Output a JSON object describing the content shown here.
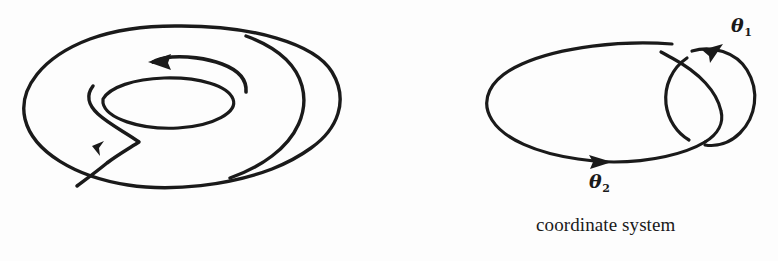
{
  "page": {
    "background_color": "#fdfdfd",
    "ink_color": "#1a1a1a",
    "width": 778,
    "height": 261
  },
  "figures": {
    "torus": {
      "name": "torus-diagram",
      "description": "torus with two oriented loop arrows",
      "arrows": [
        {
          "name": "meridian-arrow",
          "direction": "left",
          "label": ""
        },
        {
          "name": "longitude-arrow",
          "direction": "down-left",
          "label": ""
        }
      ]
    },
    "coordinate": {
      "name": "coordinate-system-diagram",
      "description": "large ellipse linked with small circle",
      "caption": "coordinate system",
      "labels": {
        "theta1": {
          "symbol": "θ",
          "subscript": "1"
        },
        "theta2": {
          "symbol": "θ",
          "subscript": "2"
        }
      },
      "arrows": [
        {
          "name": "theta1-arrow",
          "direction": "clockwise-top"
        },
        {
          "name": "theta2-arrow",
          "direction": "right-bottom"
        }
      ]
    }
  }
}
